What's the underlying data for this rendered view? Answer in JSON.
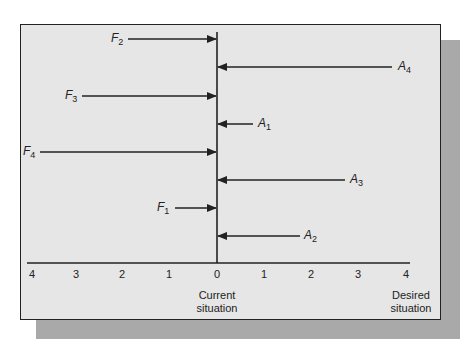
{
  "diagram": {
    "type": "force-field-analysis",
    "driving_forces": [
      {
        "name": "F",
        "sub": "1",
        "magnitude": 0.5
      },
      {
        "name": "F",
        "sub": "2",
        "magnitude": 2
      },
      {
        "name": "F",
        "sub": "3",
        "magnitude": 3
      },
      {
        "name": "F",
        "sub": "4",
        "magnitude": 4
      }
    ],
    "restraining_forces": [
      {
        "name": "A",
        "sub": "1",
        "magnitude": 0.7
      },
      {
        "name": "A",
        "sub": "2",
        "magnitude": 1.8
      },
      {
        "name": "A",
        "sub": "3",
        "magnitude": 2.7
      },
      {
        "name": "A",
        "sub": "4",
        "magnitude": 3.7
      }
    ],
    "axis_ticks_left": [
      "4",
      "3",
      "2",
      "1",
      "0"
    ],
    "axis_ticks_right": [
      "1",
      "2",
      "3",
      "4"
    ],
    "current_label_line1": "Current",
    "current_label_line2": "situation",
    "desired_label_line1": "Desired",
    "desired_label_line2": "situation",
    "colors": {
      "panel": "#e6e6e6",
      "shadow": "#a9a9a9",
      "ink": "#222222"
    }
  }
}
